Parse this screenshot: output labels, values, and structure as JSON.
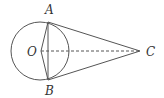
{
  "diagram": {
    "type": "geometry",
    "circle": {
      "center": "O",
      "cx": 40,
      "cy": 51,
      "r": 29
    },
    "points": {
      "A": {
        "label": "A",
        "x": 48,
        "y": 22
      },
      "B": {
        "label": "B",
        "x": 48,
        "y": 80
      },
      "O": {
        "label": "O",
        "x": 40,
        "y": 51
      },
      "C": {
        "label": "C",
        "x": 140,
        "y": 51
      }
    },
    "segments": [
      {
        "from": "A",
        "to": "C",
        "style": "solid"
      },
      {
        "from": "B",
        "to": "C",
        "style": "solid"
      },
      {
        "from": "A",
        "to": "B",
        "style": "solid"
      },
      {
        "from": "O",
        "to": "A",
        "style": "solid"
      },
      {
        "from": "O",
        "to": "B",
        "style": "solid"
      },
      {
        "from": "O",
        "to": "C",
        "style": "dashed"
      }
    ],
    "colors": {
      "stroke": "#555555",
      "background": "#ffffff"
    }
  }
}
